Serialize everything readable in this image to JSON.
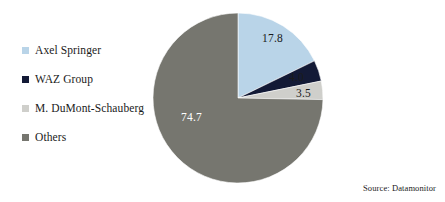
{
  "chart_data": {
    "type": "pie",
    "title": "",
    "subtitle": "",
    "xlabel": "",
    "ylabel": "",
    "legend_position": "left",
    "grid": false,
    "start_angle_deg": 0,
    "direction": "clockwise",
    "categories": [
      "Axel Springer",
      "WAZ Group",
      "M. DuMont-Schauberg",
      "Others"
    ],
    "values": [
      17.8,
      4.0,
      3.5,
      74.7
    ],
    "value_labels": [
      "17.8",
      "4.0",
      "3.5",
      "74.7"
    ],
    "colors": [
      "#b9d4e8",
      "#131a36",
      "#cfcfcb",
      "#76766f"
    ],
    "units": "percent",
    "source": "Source: Datamonitor"
  },
  "legend": {
    "items": [
      {
        "label": "Axel Springer",
        "color": "#b9d4e8",
        "marker": "square-swatch"
      },
      {
        "label": "WAZ Group",
        "color": "#131a36",
        "marker": "square-swatch"
      },
      {
        "label": "M. DuMont-Schauberg",
        "color": "#cfcfcb",
        "marker": "square-swatch"
      },
      {
        "label": "Others",
        "color": "#76766f",
        "marker": "square-swatch"
      }
    ]
  },
  "pie_labels": {
    "axel_springer": "17.8",
    "waz_group": "4.0",
    "dumont_schauberg": "3.5",
    "others": "74.7"
  },
  "footer": {
    "source": "Source: Datamonitor"
  }
}
